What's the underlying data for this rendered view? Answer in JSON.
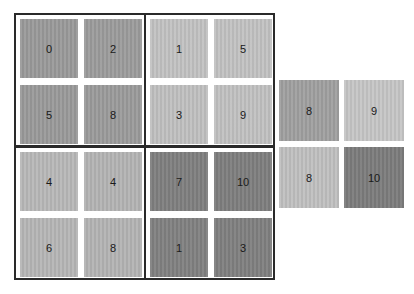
{
  "groups": [
    {
      "name": "top-left",
      "tiles": [
        {
          "label": "0",
          "color": "#9a9a9a"
        },
        {
          "label": "2",
          "color": "#9c9c9c"
        },
        {
          "label": "5",
          "color": "#9a9a9a"
        },
        {
          "label": "8",
          "color": "#9b9b9b"
        }
      ]
    },
    {
      "name": "top-right",
      "tiles": [
        {
          "label": "1",
          "color": "#c2c2c2"
        },
        {
          "label": "5",
          "color": "#c2c2c2"
        },
        {
          "label": "3",
          "color": "#c0c0c0"
        },
        {
          "label": "9",
          "color": "#c1c1c1"
        }
      ]
    },
    {
      "name": "bottom-left",
      "tiles": [
        {
          "label": "4",
          "color": "#b8b8b8"
        },
        {
          "label": "4",
          "color": "#b4b4b4"
        },
        {
          "label": "6",
          "color": "#b6b6b6"
        },
        {
          "label": "8",
          "color": "#b4b4b4"
        }
      ]
    },
    {
      "name": "bottom-right",
      "tiles": [
        {
          "label": "7",
          "color": "#7f7f7f"
        },
        {
          "label": "10",
          "color": "#7e7e7e"
        },
        {
          "label": "1",
          "color": "#818181"
        },
        {
          "label": "3",
          "color": "#808080"
        }
      ]
    }
  ],
  "separate": {
    "tiles": [
      {
        "label": "8",
        "color": "#a0a0a0"
      },
      {
        "label": "9",
        "color": "#c6c6c6"
      },
      {
        "label": "8",
        "color": "#c0c0c0"
      },
      {
        "label": "10",
        "color": "#7c7c7c"
      }
    ]
  }
}
